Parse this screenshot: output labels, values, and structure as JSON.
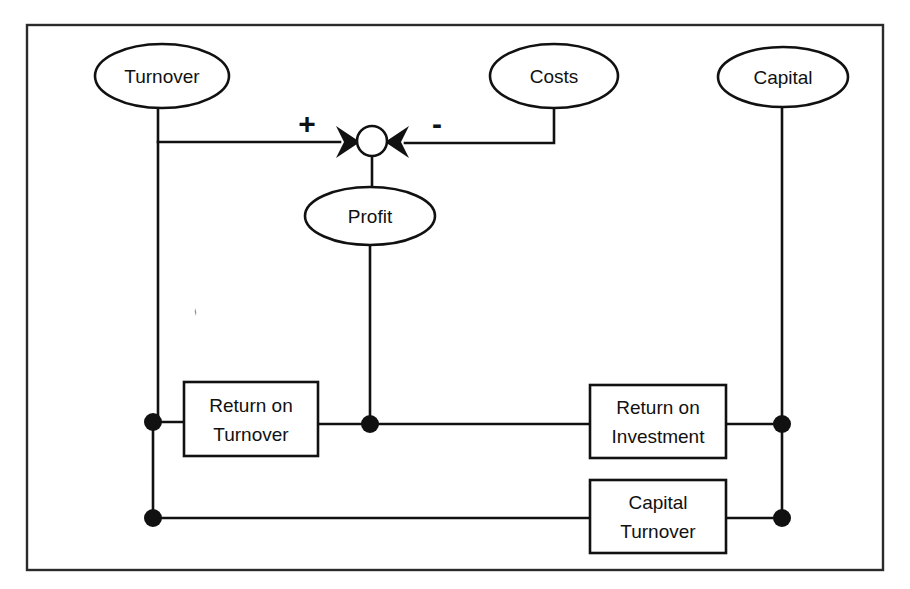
{
  "diagram": {
    "frame": {
      "name": "outer-border"
    },
    "colors": {
      "stroke": "#111111",
      "frame": "#2b2b2b",
      "background": "#ffffff"
    },
    "ellipse_nodes": [
      {
        "id": "turnover",
        "label": "Turnover",
        "cx": 162,
        "cy": 76,
        "rx": 67,
        "ry": 32
      },
      {
        "id": "costs",
        "label": "Costs",
        "cx": 554,
        "cy": 76,
        "rx": 64,
        "ry": 32
      },
      {
        "id": "capital",
        "label": "Capital",
        "cx": 783,
        "cy": 77,
        "rx": 65,
        "ry": 30
      },
      {
        "id": "profit",
        "label": "Profit",
        "cx": 370,
        "cy": 216,
        "rx": 65,
        "ry": 29
      }
    ],
    "box_nodes": [
      {
        "id": "return-on-turnover",
        "line1": "Return on",
        "line2": "Turnover",
        "x": 184,
        "y": 382,
        "w": 134,
        "h": 74
      },
      {
        "id": "return-on-investment",
        "line1": "Return on",
        "line2": "Investment",
        "x": 590,
        "y": 385,
        "w": 136,
        "h": 73
      },
      {
        "id": "capital-turnover",
        "line1": "Capital",
        "line2": "Turnover",
        "x": 590,
        "y": 480,
        "w": 136,
        "h": 73
      }
    ],
    "summing_junction": {
      "id": "profit-summing-junction",
      "cx": 372,
      "cy": 141,
      "r": 15
    },
    "signs": [
      {
        "id": "plus-sign",
        "label": "+",
        "x": 307,
        "y": 134
      },
      {
        "id": "minus-sign",
        "label": "-",
        "x": 437,
        "y": 134
      }
    ],
    "junction_dots": [
      {
        "id": "dot-turnover-roturnover",
        "cx": 153,
        "cy": 422,
        "r": 9
      },
      {
        "id": "dot-profit-roturnover",
        "cx": 370,
        "cy": 424,
        "r": 9
      },
      {
        "id": "dot-capital-roi",
        "cx": 782,
        "cy": 424,
        "r": 9
      },
      {
        "id": "dot-turnover-capitalturnover",
        "cx": 153,
        "cy": 518,
        "r": 9
      },
      {
        "id": "dot-capital-capitalturnover",
        "cx": 782,
        "cy": 518,
        "r": 9
      }
    ],
    "edges": [
      {
        "id": "edge-turnover-to-junction",
        "from": "turnover",
        "to": "profit-summing-junction",
        "sign": "+"
      },
      {
        "id": "edge-costs-to-junction",
        "from": "costs",
        "to": "profit-summing-junction",
        "sign": "-"
      },
      {
        "id": "edge-junction-to-profit",
        "from": "profit-summing-junction",
        "to": "profit"
      },
      {
        "id": "edge-profit-to-return-on-turnover",
        "from": "profit",
        "to": "return-on-turnover"
      },
      {
        "id": "edge-turnover-to-return-on-turnover",
        "from": "turnover",
        "to": "return-on-turnover"
      },
      {
        "id": "edge-turnover-to-capital-turnover",
        "from": "turnover",
        "to": "capital-turnover"
      },
      {
        "id": "edge-return-on-turnover-to-return-on-investment",
        "from": "return-on-turnover",
        "to": "return-on-investment"
      },
      {
        "id": "edge-capital-to-return-on-investment",
        "from": "capital",
        "to": "return-on-investment"
      },
      {
        "id": "edge-capital-to-capital-turnover",
        "from": "capital",
        "to": "capital-turnover"
      }
    ]
  }
}
